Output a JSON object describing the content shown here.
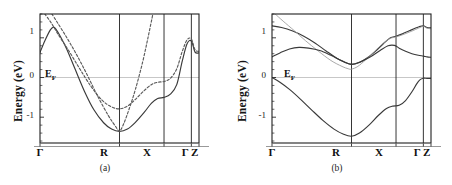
{
  "figure": {
    "panels": [
      {
        "id": "a",
        "caption": "(a)",
        "ylabel": "Energy (eV)",
        "fermi_label": "E",
        "fermi_sub": "F",
        "yticks": [
          {
            "value": 1,
            "label": "1"
          },
          {
            "value": 0,
            "label": "0"
          },
          {
            "value": -1,
            "label": "-1"
          }
        ],
        "xticks": [
          {
            "label": "Γ",
            "pos": 0.0
          },
          {
            "label": "R",
            "pos": 0.5
          },
          {
            "label": "X",
            "pos": 0.78
          },
          {
            "label": "Γ Z",
            "pos": 0.965
          }
        ]
      },
      {
        "id": "b",
        "caption": "(b)",
        "ylabel": "Energy (eV)",
        "fermi_label": "E",
        "fermi_sub": "F",
        "yticks": [
          {
            "value": 1,
            "label": "1"
          },
          {
            "value": 0,
            "label": "0"
          },
          {
            "value": -1,
            "label": "-1"
          }
        ],
        "xticks": [
          {
            "label": "Γ",
            "pos": 0.0
          },
          {
            "label": "R",
            "pos": 0.5
          },
          {
            "label": "X",
            "pos": 0.78
          },
          {
            "label": "Γ Z",
            "pos": 0.965
          }
        ]
      }
    ]
  },
  "chart_data": [
    {
      "type": "line",
      "panel": "a",
      "title": "(a)",
      "xlabel": "",
      "ylabel": "Energy (eV)",
      "ylim": [
        -1.65,
        1.6
      ],
      "xlim": [
        0,
        1
      ],
      "grid": false,
      "legend_position": "none",
      "axis_ticks_x": [
        "Γ",
        "R",
        "X",
        "Γ",
        "Z"
      ],
      "axis_tick_positions_x": [
        0.0,
        0.5,
        0.78,
        0.952,
        1.0
      ],
      "axis_ticks_y": [
        1,
        0,
        -1
      ],
      "annotations": [
        {
          "text": "E_F",
          "y": 0.0,
          "x": 0.055,
          "type": "fermi-level-label"
        }
      ],
      "fermi_level": 0.0,
      "series": [
        {
          "name": "band-1-solid",
          "style": "solid",
          "color": "#3a3a3a",
          "x": [
            0.0,
            0.03,
            0.065,
            0.085,
            0.1,
            0.13,
            0.17,
            0.22,
            0.28,
            0.34,
            0.4,
            0.45,
            0.5,
            0.55,
            0.6,
            0.655,
            0.7,
            0.74,
            0.78,
            0.82,
            0.86,
            0.895,
            0.925,
            0.952,
            0.975,
            1.0
          ],
          "y": [
            0.63,
            0.92,
            1.2,
            1.27,
            1.22,
            1.02,
            0.7,
            0.22,
            -0.35,
            -0.82,
            -1.14,
            -1.3,
            -1.36,
            -1.3,
            -1.13,
            -0.88,
            -0.65,
            -0.53,
            -0.5,
            -0.42,
            -0.18,
            0.42,
            0.85,
            0.92,
            0.64,
            0.62
          ]
        },
        {
          "name": "band-2-dashed",
          "style": "dashed",
          "color": "#5a5a5a",
          "x": [
            0.03,
            0.07,
            0.12,
            0.18,
            0.25,
            0.32,
            0.39,
            0.45,
            0.5,
            0.55,
            0.6,
            0.65,
            0.7,
            0.74,
            0.78,
            0.82,
            0.86,
            0.895,
            0.925,
            0.952,
            0.975,
            1.0
          ],
          "y": [
            1.6,
            1.38,
            1.05,
            0.68,
            0.22,
            -0.22,
            -0.57,
            -0.74,
            -0.79,
            -0.72,
            -0.55,
            -0.35,
            -0.18,
            -0.12,
            -0.1,
            -0.02,
            0.22,
            0.66,
            0.95,
            0.97,
            0.7,
            0.66
          ]
        },
        {
          "name": "band-3-dashed",
          "style": "dashed",
          "color": "#5a5a5a",
          "x": [
            0.075,
            0.11,
            0.16,
            0.22,
            0.29,
            0.36,
            0.43,
            0.48,
            0.5,
            0.525,
            0.56,
            0.6,
            0.645,
            0.68,
            0.71
          ],
          "y": [
            1.6,
            1.38,
            1.06,
            0.65,
            0.12,
            -0.45,
            -0.96,
            -1.26,
            -1.35,
            -1.18,
            -0.8,
            -0.3,
            0.38,
            1.02,
            1.6
          ]
        }
      ]
    },
    {
      "type": "line",
      "panel": "b",
      "title": "(b)",
      "xlabel": "",
      "ylabel": "Energy (eV)",
      "ylim": [
        -1.65,
        1.6
      ],
      "xlim": [
        0,
        1
      ],
      "grid": false,
      "legend_position": "none",
      "axis_ticks_x": [
        "Γ",
        "R",
        "X",
        "Γ",
        "Z"
      ],
      "axis_tick_positions_x": [
        0.0,
        0.5,
        0.78,
        0.952,
        1.0
      ],
      "axis_ticks_y": [
        1,
        0,
        -1
      ],
      "annotations": [
        {
          "text": "E_F",
          "y": 0.0,
          "x": 0.09,
          "type": "fermi-level-label"
        }
      ],
      "fermi_level": 0.0,
      "series": [
        {
          "name": "band-1-upper-solid",
          "style": "solid",
          "color": "#3a3a3a",
          "x": [
            0.0,
            0.06,
            0.13,
            0.2,
            0.27,
            0.34,
            0.41,
            0.46,
            0.5,
            0.55,
            0.6,
            0.65,
            0.7,
            0.745,
            0.78,
            0.82,
            0.86,
            0.9,
            0.925,
            0.952,
            0.975,
            1.0
          ],
          "y": [
            1.3,
            1.26,
            1.17,
            1.04,
            0.87,
            0.67,
            0.48,
            0.38,
            0.33,
            0.38,
            0.5,
            0.66,
            0.85,
            1.0,
            1.04,
            1.1,
            1.17,
            1.24,
            1.28,
            1.3,
            1.26,
            1.25
          ]
        },
        {
          "name": "band-2-light-solid",
          "style": "solid-light",
          "color": "#9a9a9a",
          "x": [
            0.02,
            0.07,
            0.14,
            0.21,
            0.29,
            0.37,
            0.44,
            0.48,
            0.5,
            0.54,
            0.59,
            0.64,
            0.69,
            0.74,
            0.78,
            0.83,
            0.88,
            0.92,
            0.952,
            0.975,
            1.0
          ],
          "y": [
            1.6,
            1.42,
            1.18,
            0.93,
            0.67,
            0.43,
            0.28,
            0.22,
            0.21,
            0.28,
            0.45,
            0.64,
            0.83,
            0.98,
            1.02,
            1.09,
            1.17,
            1.24,
            1.29,
            1.24,
            1.23
          ]
        },
        {
          "name": "band-3-middle-solid",
          "style": "solid",
          "color": "#3a3a3a",
          "x": [
            0.0,
            0.05,
            0.11,
            0.17,
            0.23,
            0.3,
            0.37,
            0.44,
            0.5,
            0.56,
            0.62,
            0.68,
            0.73,
            0.77,
            0.8,
            0.84,
            0.88,
            0.92,
            0.952,
            0.975,
            1.0
          ],
          "y": [
            0.52,
            0.62,
            0.72,
            0.76,
            0.74,
            0.68,
            0.56,
            0.42,
            0.33,
            0.4,
            0.52,
            0.68,
            0.8,
            0.81,
            0.74,
            0.66,
            0.6,
            0.56,
            0.54,
            0.52,
            0.51
          ]
        },
        {
          "name": "band-4-lower-solid",
          "style": "solid",
          "color": "#3a3a3a",
          "x": [
            0.0,
            0.05,
            0.11,
            0.18,
            0.25,
            0.32,
            0.39,
            0.45,
            0.5,
            0.55,
            0.61,
            0.67,
            0.72,
            0.76,
            0.8,
            0.84,
            0.88,
            0.91,
            0.93,
            0.952,
            0.975,
            1.0
          ],
          "y": [
            0.0,
            -0.12,
            -0.3,
            -0.55,
            -0.82,
            -1.08,
            -1.3,
            -1.43,
            -1.48,
            -1.4,
            -1.2,
            -0.95,
            -0.78,
            -0.72,
            -0.7,
            -0.58,
            -0.36,
            -0.16,
            -0.06,
            -0.02,
            -0.02,
            -0.02
          ]
        }
      ]
    }
  ]
}
